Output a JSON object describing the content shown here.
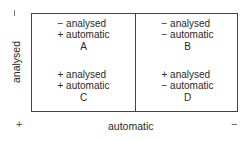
{
  "diagram": {
    "y_axis": {
      "label": "analysed",
      "top_marker": "−",
      "bottom_marker": "+"
    },
    "x_axis": {
      "label": "automatic",
      "left_marker": "+",
      "right_marker": "−"
    },
    "cells": [
      {
        "id": "A",
        "line1": "− analysed",
        "line2": "+ automatic",
        "letter": "A"
      },
      {
        "id": "B",
        "line1": "− analysed",
        "line2": "− automatic",
        "letter": "B"
      },
      {
        "id": "C",
        "line1": "+ analysed",
        "line2": "+ automatic",
        "letter": "C"
      },
      {
        "id": "D",
        "line1": "+ analysed",
        "line2": "− automatic",
        "letter": "D"
      }
    ]
  }
}
